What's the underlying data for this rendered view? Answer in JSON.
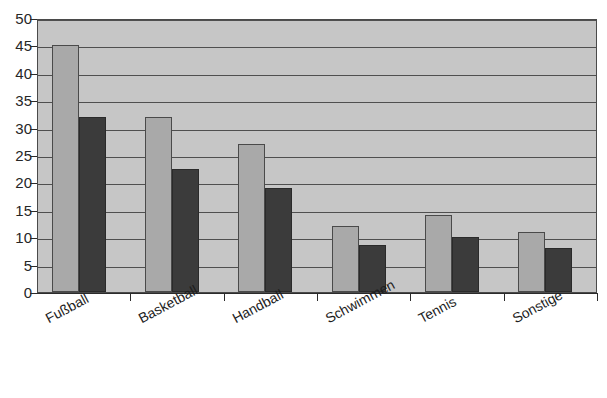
{
  "chart_data": {
    "type": "bar",
    "title": "",
    "subtitle": "",
    "xlabel": "",
    "ylabel": "",
    "categories": [
      "Fußball",
      "Basketball",
      "Handball",
      "Schwimmen",
      "Tennis",
      "Sonstige"
    ],
    "series": [
      {
        "name": "Serie 1",
        "color": "#a9a9a9",
        "values": [
          45,
          32,
          27,
          12,
          14,
          11
        ]
      },
      {
        "name": "Serie 2",
        "color": "#3b3b3b",
        "values": [
          32,
          22.5,
          19,
          8.5,
          10,
          8
        ]
      }
    ],
    "ylim": [
      0,
      50
    ],
    "ytick_step": 5,
    "ytick_labels": [
      "0",
      "5",
      "10",
      "15",
      "20",
      "25",
      "30",
      "35",
      "40",
      "45",
      "50"
    ],
    "grid": true,
    "grid_axis": "y",
    "legend": false,
    "legend_position": "none",
    "plot_background": "#c6c6c6",
    "axis_color": "#2b2b2b",
    "gridline_color": "#4f4f4f"
  }
}
